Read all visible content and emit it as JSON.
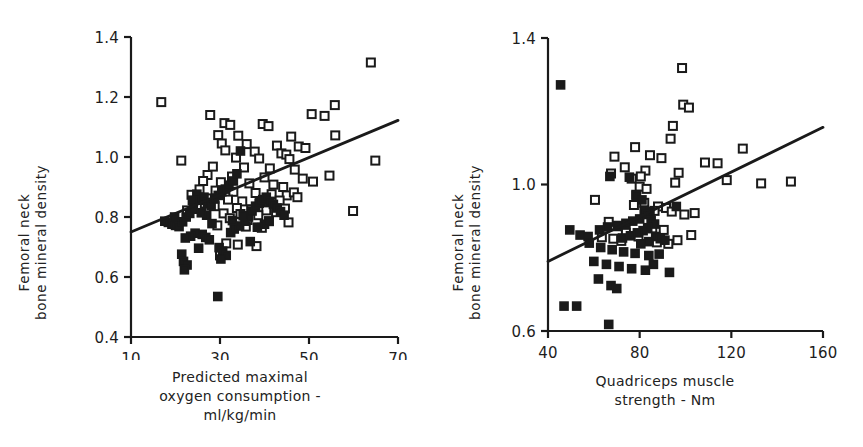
{
  "figure": {
    "background": "#ffffff",
    "ink": "#1a1a1a",
    "panel_count": 2
  },
  "chart_data": [
    {
      "panel": "left",
      "type": "scatter",
      "title": "",
      "xlabel": "Predicted maximal oxygen consumption - ml/kg/min",
      "xlabel_lines": [
        "Predicted maximal",
        "oxygen consumption -",
        "ml/kg/min"
      ],
      "ylabel": "Femoral neck bone mineral density",
      "ylabel_lines": [
        "Femoral neck",
        "bone mineral density"
      ],
      "xlim": [
        10,
        70
      ],
      "ylim": [
        0.4,
        1.4
      ],
      "xticks": [
        10,
        30,
        50,
        70
      ],
      "xticklabels": [
        "10",
        "30",
        "50",
        "70"
      ],
      "yticks": [
        0.4,
        0.6,
        0.8,
        1.0,
        1.2,
        1.4
      ],
      "yticklabels": [
        "0.4",
        "0.6",
        "0.8",
        "1.0",
        "1.2",
        "1.4"
      ],
      "grid": false,
      "legend": "none",
      "series": [
        {
          "name": "open-square",
          "marker": "open-square",
          "color": "#1a1a1a",
          "points": [
            [
              16.8,
              1.183
            ],
            [
              63.9,
              1.315
            ],
            [
              55.8,
              1.173
            ],
            [
              50.6,
              1.143
            ],
            [
              53.5,
              1.137
            ],
            [
              55.9,
              1.072
            ],
            [
              27.8,
              1.14
            ],
            [
              31.0,
              1.113
            ],
            [
              32.3,
              1.107
            ],
            [
              39.6,
              1.11
            ],
            [
              40.9,
              1.103
            ],
            [
              29.6,
              1.073
            ],
            [
              34.1,
              1.071
            ],
            [
              46.0,
              1.068
            ],
            [
              30.4,
              1.045
            ],
            [
              36.0,
              1.043
            ],
            [
              42.8,
              1.038
            ],
            [
              47.7,
              1.035
            ],
            [
              49.2,
              1.03
            ],
            [
              31.2,
              1.022
            ],
            [
              37.8,
              1.018
            ],
            [
              43.8,
              1.012
            ],
            [
              44.9,
              1.008
            ],
            [
              21.3,
              0.988
            ],
            [
              33.6,
              0.998
            ],
            [
              38.8,
              0.995
            ],
            [
              45.6,
              0.993
            ],
            [
              64.9,
              0.988
            ],
            [
              28.4,
              0.968
            ],
            [
              35.4,
              0.965
            ],
            [
              41.2,
              0.962
            ],
            [
              46.8,
              0.958
            ],
            [
              27.2,
              0.94
            ],
            [
              32.7,
              0.935
            ],
            [
              40.0,
              0.932
            ],
            [
              48.6,
              0.928
            ],
            [
              54.6,
              0.938
            ],
            [
              26.2,
              0.92
            ],
            [
              30.2,
              0.916
            ],
            [
              36.6,
              0.912
            ],
            [
              42.0,
              0.908
            ],
            [
              44.2,
              0.9
            ],
            [
              50.9,
              0.918
            ],
            [
              25.4,
              0.892
            ],
            [
              29.0,
              0.888
            ],
            [
              33.0,
              0.884
            ],
            [
              38.0,
              0.88
            ],
            [
              41.6,
              0.876
            ],
            [
              45.0,
              0.872
            ],
            [
              46.6,
              0.882
            ],
            [
              23.6,
              0.874
            ],
            [
              27.6,
              0.862
            ],
            [
              31.8,
              0.858
            ],
            [
              35.0,
              0.852
            ],
            [
              39.0,
              0.848
            ],
            [
              43.4,
              0.855
            ],
            [
              47.4,
              0.866
            ],
            [
              24.8,
              0.84
            ],
            [
              28.8,
              0.836
            ],
            [
              33.8,
              0.83
            ],
            [
              37.0,
              0.826
            ],
            [
              40.4,
              0.822
            ],
            [
              44.6,
              0.828
            ],
            [
              22.6,
              0.822
            ],
            [
              26.8,
              0.818
            ],
            [
              30.8,
              0.812
            ],
            [
              34.6,
              0.81
            ],
            [
              38.6,
              0.806
            ],
            [
              42.6,
              0.816
            ],
            [
              59.9,
              0.82
            ],
            [
              32.2,
              0.796
            ],
            [
              36.2,
              0.79
            ],
            [
              41.0,
              0.786
            ],
            [
              45.4,
              0.782
            ],
            [
              29.4,
              0.772
            ],
            [
              35.8,
              0.768
            ],
            [
              39.4,
              0.764
            ],
            [
              31.4,
              0.712
            ],
            [
              34.0,
              0.708
            ],
            [
              38.2,
              0.703
            ],
            [
              30.0,
              0.672
            ]
          ]
        },
        {
          "name": "filled-square",
          "marker": "filled-square",
          "color": "#1a1a1a",
          "points": [
            [
              17.6,
              0.786
            ],
            [
              18.4,
              0.782
            ],
            [
              19.2,
              0.776
            ],
            [
              20.0,
              0.772
            ],
            [
              20.8,
              0.768
            ],
            [
              21.6,
              0.784
            ],
            [
              22.4,
              0.8
            ],
            [
              23.2,
              0.812
            ],
            [
              24.0,
              0.826
            ],
            [
              24.8,
              0.876
            ],
            [
              25.6,
              0.856
            ],
            [
              26.4,
              0.866
            ],
            [
              27.2,
              0.848
            ],
            [
              28.0,
              0.838
            ],
            [
              28.8,
              0.86
            ],
            [
              29.6,
              0.872
            ],
            [
              30.4,
              0.884
            ],
            [
              31.2,
              0.893
            ],
            [
              32.0,
              0.906
            ],
            [
              33.0,
              0.92
            ],
            [
              33.8,
              0.944
            ],
            [
              34.6,
              1.02
            ],
            [
              26.0,
              0.742
            ],
            [
              26.8,
              0.732
            ],
            [
              27.6,
              0.724
            ],
            [
              24.4,
              0.746
            ],
            [
              23.4,
              0.736
            ],
            [
              22.2,
              0.73
            ],
            [
              21.4,
              0.676
            ],
            [
              21.8,
              0.652
            ],
            [
              22.6,
              0.64
            ],
            [
              22.0,
              0.624
            ],
            [
              29.8,
              0.698
            ],
            [
              30.6,
              0.686
            ],
            [
              31.4,
              0.672
            ],
            [
              30.2,
              0.66
            ],
            [
              32.4,
              0.748
            ],
            [
              33.2,
              0.76
            ],
            [
              34.4,
              0.77
            ],
            [
              35.6,
              0.786
            ],
            [
              36.4,
              0.8
            ],
            [
              37.2,
              0.82
            ],
            [
              38.0,
              0.836
            ],
            [
              38.8,
              0.846
            ],
            [
              39.6,
              0.858
            ],
            [
              40.4,
              0.866
            ],
            [
              41.2,
              0.852
            ],
            [
              42.0,
              0.842
            ],
            [
              42.8,
              0.83
            ],
            [
              43.6,
              0.818
            ],
            [
              44.4,
              0.806
            ],
            [
              40.0,
              0.776
            ],
            [
              41.0,
              0.786
            ],
            [
              38.4,
              0.766
            ],
            [
              36.8,
              0.718
            ],
            [
              29.5,
              0.535
            ],
            [
              25.2,
              0.696
            ],
            [
              28.2,
              0.778
            ],
            [
              32.8,
              0.788
            ],
            [
              35.2,
              0.804
            ],
            [
              27.0,
              0.806
            ],
            [
              25.8,
              0.814
            ],
            [
              19.8,
              0.8
            ],
            [
              23.8,
              0.856
            ]
          ]
        }
      ],
      "regression_line": {
        "x": [
          10,
          70
        ],
        "y": [
          0.75,
          1.122
        ]
      }
    },
    {
      "panel": "right",
      "type": "scatter",
      "title": "",
      "xlabel": "Quadriceps muscle strength - Nm",
      "xlabel_lines": [
        "Quadriceps muscle",
        "strength - Nm"
      ],
      "ylabel": "Femoral neck bone mineral density",
      "ylabel_lines": [
        "Femoral neck",
        "bone mineral density"
      ],
      "xlim": [
        40,
        160
      ],
      "ylim": [
        0.6,
        1.4
      ],
      "xticks": [
        40,
        80,
        120,
        160
      ],
      "xticklabels": [
        "40",
        "80",
        "120",
        "160"
      ],
      "yticks": [
        0.6,
        1.0,
        1.4
      ],
      "yticklabels": [
        "0.6",
        "1.0",
        "1.4"
      ],
      "grid": false,
      "legend": "none",
      "series": [
        {
          "name": "open-square",
          "marker": "open-square",
          "color": "#1a1a1a",
          "points": [
            [
              98.5,
              1.318
            ],
            [
              99.0,
              1.218
            ],
            [
              101.5,
              1.21
            ],
            [
              94.5,
              1.16
            ],
            [
              93.5,
              1.125
            ],
            [
              78.0,
              1.102
            ],
            [
              125.0,
              1.098
            ],
            [
              69.0,
              1.076
            ],
            [
              84.5,
              1.08
            ],
            [
              89.5,
              1.072
            ],
            [
              108.5,
              1.06
            ],
            [
              114.0,
              1.058
            ],
            [
              73.5,
              1.047
            ],
            [
              67.5,
              1.03
            ],
            [
              82.5,
              1.038
            ],
            [
              97.0,
              1.032
            ],
            [
              80.5,
              1.022
            ],
            [
              76.5,
              1.016
            ],
            [
              95.5,
              1.005
            ],
            [
              133.0,
              1.003
            ],
            [
              146.0,
              1.008
            ],
            [
              118.0,
              1.012
            ],
            [
              80.0,
              0.994
            ],
            [
              83.0,
              0.988
            ],
            [
              78.5,
              0.972
            ],
            [
              60.5,
              0.958
            ],
            [
              82.0,
              0.95
            ],
            [
              77.5,
              0.944
            ],
            [
              88.0,
              0.94
            ],
            [
              91.5,
              0.936
            ],
            [
              86.5,
              0.928
            ],
            [
              94.0,
              0.926
            ],
            [
              104.0,
              0.922
            ],
            [
              99.5,
              0.918
            ],
            [
              66.5,
              0.898
            ],
            [
              70.5,
              0.886
            ],
            [
              85.5,
              0.88
            ],
            [
              90.5,
              0.876
            ],
            [
              74.0,
              0.868
            ],
            [
              63.5,
              0.856
            ],
            [
              68.5,
              0.852
            ],
            [
              79.5,
              0.858
            ],
            [
              102.5,
              0.862
            ],
            [
              72.0,
              0.846
            ],
            [
              87.5,
              0.842
            ],
            [
              92.5,
              0.838
            ],
            [
              96.5,
              0.848
            ]
          ]
        },
        {
          "name": "filled-square",
          "marker": "filled-square",
          "color": "#1a1a1a",
          "points": [
            [
              45.5,
              1.272
            ],
            [
              75.5,
              1.02
            ],
            [
              67.0,
              1.022
            ],
            [
              78.5,
              0.97
            ],
            [
              81.0,
              0.958
            ],
            [
              96.0,
              0.94
            ],
            [
              82.0,
              0.93
            ],
            [
              84.5,
              0.926
            ],
            [
              83.0,
              0.918
            ],
            [
              80.0,
              0.906
            ],
            [
              77.0,
              0.9
            ],
            [
              74.0,
              0.894
            ],
            [
              70.5,
              0.888
            ],
            [
              66.0,
              0.884
            ],
            [
              62.5,
              0.876
            ],
            [
              49.5,
              0.876
            ],
            [
              54.0,
              0.862
            ],
            [
              57.5,
              0.858
            ],
            [
              85.0,
              0.902
            ],
            [
              86.5,
              0.892
            ],
            [
              83.5,
              0.882
            ],
            [
              81.5,
              0.874
            ],
            [
              79.0,
              0.868
            ],
            [
              76.0,
              0.86
            ],
            [
              72.5,
              0.854
            ],
            [
              87.0,
              0.858
            ],
            [
              89.0,
              0.852
            ],
            [
              91.0,
              0.848
            ],
            [
              84.0,
              0.844
            ],
            [
              80.5,
              0.838
            ],
            [
              58.0,
              0.84
            ],
            [
              63.0,
              0.828
            ],
            [
              68.0,
              0.822
            ],
            [
              73.0,
              0.816
            ],
            [
              78.0,
              0.812
            ],
            [
              84.0,
              0.806
            ],
            [
              88.5,
              0.81
            ],
            [
              60.0,
              0.79
            ],
            [
              65.5,
              0.782
            ],
            [
              71.0,
              0.776
            ],
            [
              76.5,
              0.77
            ],
            [
              82.5,
              0.766
            ],
            [
              93.0,
              0.76
            ],
            [
              86.0,
              0.782
            ],
            [
              62.0,
              0.742
            ],
            [
              67.5,
              0.724
            ],
            [
              70.0,
              0.716
            ],
            [
              47.0,
              0.668
            ],
            [
              52.5,
              0.668
            ],
            [
              66.5,
              0.618
            ]
          ]
        }
      ],
      "regression_line": {
        "x": [
          40,
          160
        ],
        "y": [
          0.79,
          1.156
        ]
      }
    }
  ]
}
